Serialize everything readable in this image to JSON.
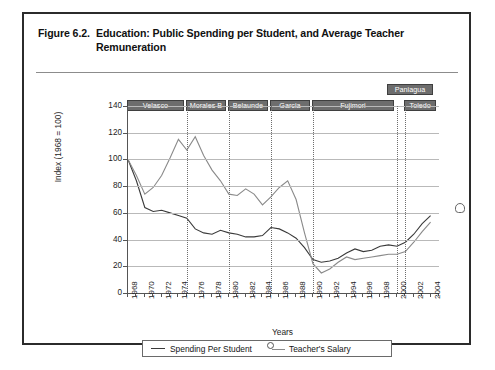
{
  "figure": {
    "number": "Figure 6.2.",
    "title": "Education: Public Spending per Student, and Average Teacher Remuneration"
  },
  "legend": {
    "spending_label": "Spending Per Student",
    "salary_label": "Teacher's Salary"
  },
  "axes": {
    "ylabel": "Index (1968 = 100)",
    "xlabel": "Years"
  },
  "presidents": [
    {
      "name": "Velasco",
      "start": 1968,
      "end": 1975
    },
    {
      "name": "Morales B",
      "start": 1975,
      "end": 1980
    },
    {
      "name": "Belaunde",
      "start": 1980,
      "end": 1985
    },
    {
      "name": "Garcia",
      "start": 1985,
      "end": 1990
    },
    {
      "name": "Fujimori",
      "start": 1990,
      "end": 2000
    },
    {
      "name": "Paniagua",
      "start": 2000,
      "end": 2001
    },
    {
      "name": "Toledo",
      "start": 2001,
      "end": 2005
    }
  ],
  "chart_data": {
    "type": "line",
    "title": "Education: Public Spending per Student, and Average Teacher Remuneration",
    "xlabel": "Years",
    "ylabel": "Index (1968 = 100)",
    "xlim": [
      1968,
      2005
    ],
    "ylim": [
      0,
      140
    ],
    "ytick_values": [
      0,
      20,
      40,
      60,
      80,
      100,
      120,
      140
    ],
    "xtick_values": [
      1968,
      1970,
      1972,
      1974,
      1976,
      1978,
      1980,
      1982,
      1984,
      1986,
      1988,
      1990,
      1992,
      1994,
      1996,
      1998,
      2000,
      2002,
      2004
    ],
    "grid": true,
    "legend_position": "bottom",
    "x": [
      1968,
      1969,
      1970,
      1971,
      1972,
      1973,
      1974,
      1975,
      1976,
      1977,
      1978,
      1979,
      1980,
      1981,
      1982,
      1983,
      1984,
      1985,
      1986,
      1987,
      1988,
      1989,
      1990,
      1991,
      1992,
      1993,
      1994,
      1995,
      1996,
      1997,
      1998,
      1999,
      2000,
      2001,
      2002,
      2003,
      2004
    ],
    "series": [
      {
        "name": "Spending Per Student",
        "color": "#3a3a3a",
        "values": [
          100,
          84,
          64,
          61,
          62,
          60,
          58,
          56,
          48,
          45,
          44,
          47,
          45,
          44,
          42,
          42,
          43,
          49,
          48,
          45,
          41,
          34,
          25,
          23,
          24,
          26,
          30,
          33,
          31,
          32,
          35,
          36,
          35,
          38,
          44,
          52,
          58
        ]
      },
      {
        "name": "Teacher's Salary",
        "color": "#8a8a8a",
        "values": [
          100,
          88,
          74,
          79,
          88,
          101,
          115,
          107,
          117,
          103,
          92,
          84,
          74,
          73,
          78,
          74,
          66,
          72,
          79,
          84,
          70,
          45,
          22,
          15,
          18,
          23,
          27,
          25,
          26,
          27,
          28,
          29,
          29,
          31,
          38,
          46,
          53
        ]
      }
    ],
    "end_marker": {
      "value": 60,
      "x": 2006,
      "shape": "pentagon"
    }
  }
}
